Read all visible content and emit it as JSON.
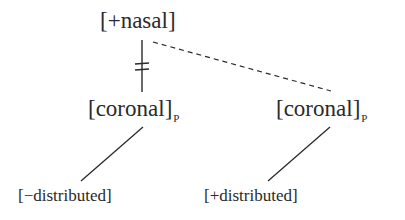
{
  "diagram": {
    "type": "feature-geometry-tree",
    "root": {
      "label": "[+nasal]"
    },
    "nodes": [
      {
        "id": "coronal-left",
        "label": "[coronal]",
        "subscript": "P",
        "link_to_root": "delinked",
        "child": {
          "label": "[−distributed]"
        }
      },
      {
        "id": "coronal-right",
        "label": "[coronal]",
        "subscript": "P",
        "link_to_root": "dashed",
        "child": {
          "label": "[+distributed]"
        }
      }
    ],
    "colors": {
      "ink": "#2a2a2a",
      "background": "#ffffff"
    }
  }
}
